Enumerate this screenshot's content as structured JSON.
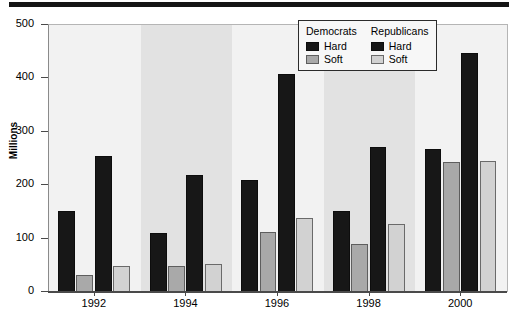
{
  "chart_data": {
    "type": "bar",
    "title": "",
    "xlabel": "",
    "ylabel": "Millions",
    "ylim": [
      0,
      500
    ],
    "yticks": [
      0,
      100,
      200,
      300,
      400,
      500
    ],
    "grid": false,
    "legend_position": "top-right",
    "categories": [
      "1992",
      "1994",
      "1996",
      "1998",
      "2000"
    ],
    "series": [
      {
        "name": "Democrats Hard",
        "party": "Democrats",
        "money": "Hard",
        "color": "#171717",
        "values": [
          152,
          111,
          210,
          152,
          268
        ]
      },
      {
        "name": "Democrats Soft",
        "party": "Democrats",
        "money": "Soft",
        "color": "#a9a9a9",
        "values": [
          31,
          49,
          112,
          90,
          243
        ]
      },
      {
        "name": "Republicans Hard",
        "party": "Republicans",
        "money": "Hard",
        "color": "#171717",
        "values": [
          255,
          219,
          408,
          272,
          447
        ]
      },
      {
        "name": "Republicans Soft",
        "party": "Republicans",
        "money": "Soft",
        "color": "#d2d2d2",
        "values": [
          48,
          53,
          138,
          127,
          245
        ]
      }
    ]
  },
  "legend": {
    "groups": [
      {
        "title": "Democrats",
        "entries": [
          {
            "label": "Hard",
            "swatch": "hard"
          },
          {
            "label": "Soft",
            "swatch": "dsoft"
          }
        ]
      },
      {
        "title": "Republicans",
        "entries": [
          {
            "label": "Hard",
            "swatch": "hard"
          },
          {
            "label": "Soft",
            "swatch": "rsoft"
          }
        ]
      }
    ]
  },
  "axis": {
    "y_title": "Millions",
    "y_tick_labels": [
      "500",
      "400",
      "300",
      "200",
      "100",
      "0"
    ],
    "x_tick_labels": [
      "1992",
      "1994",
      "1996",
      "1998",
      "2000"
    ]
  }
}
